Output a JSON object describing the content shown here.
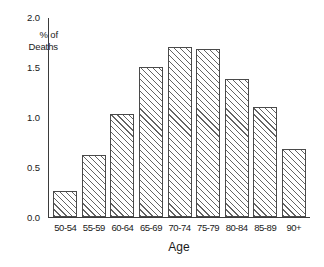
{
  "chart_data": {
    "type": "bar",
    "title": "",
    "subtitle": "",
    "xlabel": "Age",
    "ylabel": "% of Deaths",
    "ylabel_lines": [
      "% of",
      "Deaths"
    ],
    "categories": [
      "50-54",
      "55-59",
      "60-64",
      "65-69",
      "70-74",
      "75-79",
      "80-84",
      "85-89",
      "90+"
    ],
    "values": [
      0.26,
      0.62,
      1.04,
      1.51,
      1.71,
      1.69,
      1.39,
      1.11,
      0.68
    ],
    "ylim": [
      0.0,
      2.0
    ],
    "yticks": [
      0.0,
      0.5,
      1.0,
      1.5,
      2.0
    ],
    "ytick_labels": [
      "0.0",
      "0.5",
      "1.0",
      "1.5",
      "2.0"
    ],
    "grid": false,
    "legend": false,
    "legend_position": "none",
    "bar_fill": "#ffffff",
    "bar_hatch": "diagonal-forward",
    "bar_edge_color": "#4a4a4a",
    "axis_color": "#3b3b3b",
    "background": "#ffffff"
  }
}
